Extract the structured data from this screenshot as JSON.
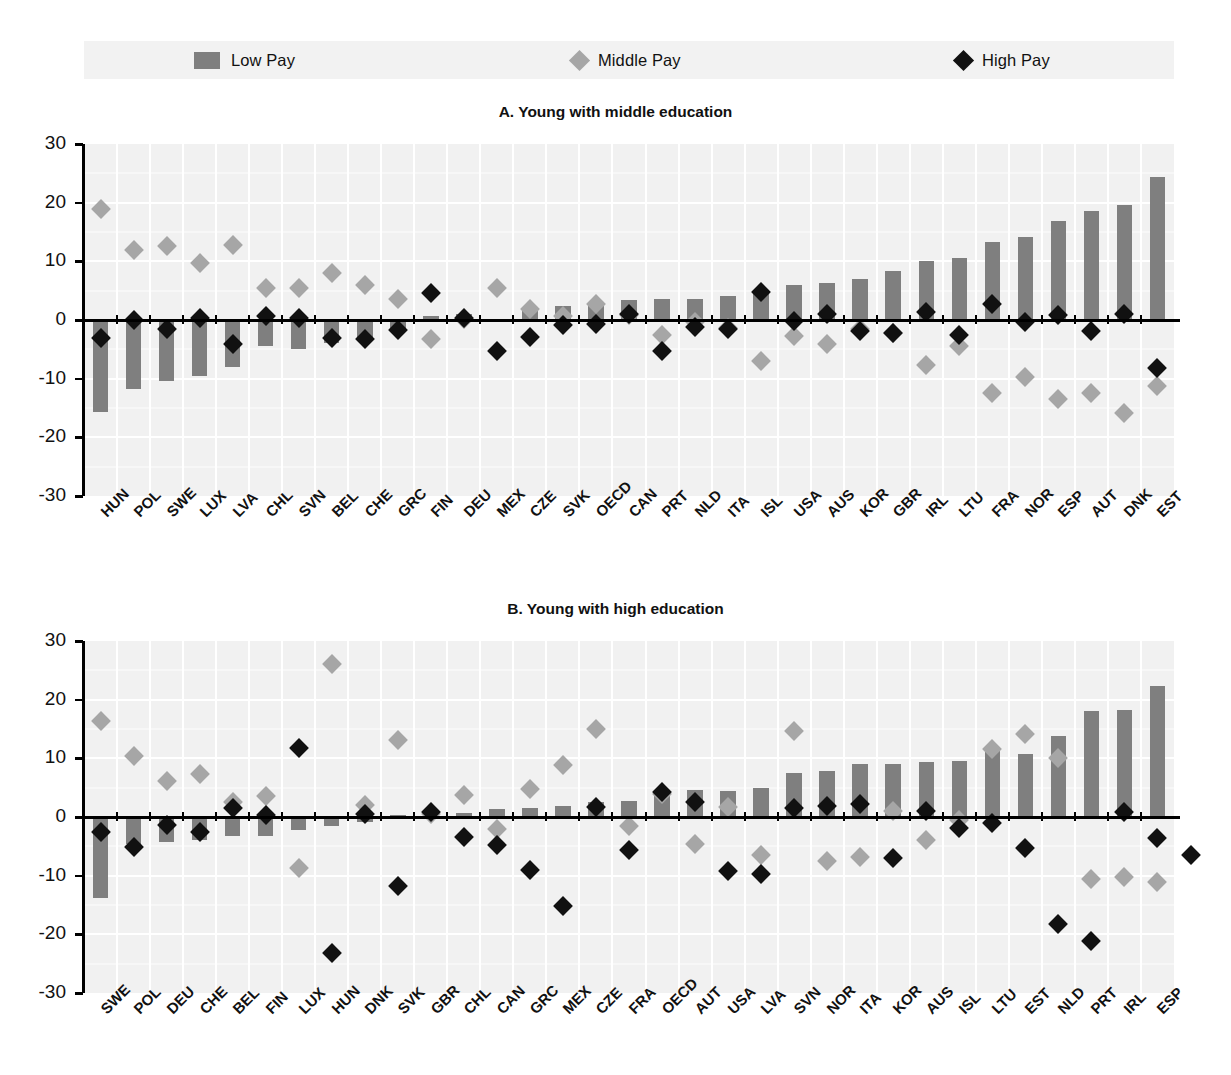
{
  "legend": {
    "items": [
      {
        "label": "Low Pay",
        "marker": "bar-swatch",
        "color": "#7f7f7f"
      },
      {
        "label": "Middle Pay",
        "marker": "diamond-marker",
        "color": "#a6a6a6"
      },
      {
        "label": "High Pay",
        "marker": "diamond-marker",
        "color": "#111111"
      }
    ]
  },
  "axis": {
    "ticks": [
      "30",
      "20",
      "10",
      "0",
      "-10",
      "-20",
      "-30"
    ],
    "ymin": -30,
    "ymax": 30
  },
  "chart_data": [
    {
      "type": "bar",
      "title": "A. Young with middle education",
      "xlabel": "",
      "ylabel": "",
      "ylim": [
        -30,
        30
      ],
      "grid": true,
      "legend_position": "top",
      "categories": [
        "HUN",
        "POL",
        "SWE",
        "LUX",
        "LVA",
        "CHL",
        "SVN",
        "BEL",
        "CHE",
        "GRC",
        "FIN",
        "DEU",
        "MEX",
        "CZE",
        "SVK",
        "OECD",
        "CAN",
        "PRT",
        "NLD",
        "ITA",
        "ISL",
        "USA",
        "AUS",
        "KOR",
        "GBR",
        "IRL",
        "LTU",
        "FRA",
        "NOR",
        "ESP",
        "AUT",
        "DNK",
        "EST"
      ],
      "series": [
        {
          "name": "Low Pay",
          "kind": "bar",
          "color": "#7f7f7f",
          "values": [
            -15.7,
            -11.8,
            -10.4,
            -9.6,
            -8.0,
            -4.5,
            -4.9,
            -4.0,
            -3.4,
            -2.0,
            0.6,
            1.0,
            0.1,
            1.7,
            2.4,
            2.8,
            3.4,
            3.6,
            3.6,
            4.1,
            4.5,
            6.0,
            6.3,
            7.0,
            8.4,
            10.1,
            10.5,
            13.3,
            14.1,
            16.9,
            18.5,
            19.6,
            24.3
          ]
        },
        {
          "name": "Middle Pay",
          "kind": "diamond",
          "color": "#a6a6a6",
          "values": [
            18.9,
            12.0,
            12.6,
            9.7,
            12.7,
            5.4,
            5.4,
            8.0,
            6.0,
            3.6,
            -3.2,
            0.2,
            5.5,
            1.8,
            0.7,
            2.8,
            0.9,
            -2.6,
            -0.4,
            -1.4,
            -7.0,
            -2.8,
            -4.1,
            -1.6,
            -2.3,
            -7.7,
            -4.5,
            -12.4,
            -9.7,
            -13.4,
            -12.4,
            -15.9,
            -11.3
          ]
        },
        {
          "name": "High Pay",
          "kind": "diamond",
          "color": "#111111",
          "values": [
            -3.0,
            0.0,
            -1.6,
            0.3,
            -4.1,
            0.7,
            0.4,
            -3.1,
            -3.2,
            -1.7,
            4.6,
            0.4,
            -5.2,
            -2.9,
            -0.8,
            -0.7,
            1.1,
            -5.3,
            -1.2,
            -1.5,
            4.8,
            -0.2,
            1.0,
            -1.8,
            -2.2,
            1.4,
            -2.5,
            2.8,
            -0.4,
            0.8,
            -1.8,
            1.0,
            -8.2
          ]
        }
      ]
    },
    {
      "type": "bar",
      "title": "B. Young with high education",
      "xlabel": "",
      "ylabel": "",
      "ylim": [
        -30,
        30
      ],
      "grid": true,
      "legend_position": "top",
      "categories": [
        "SWE",
        "POL",
        "DEU",
        "CHE",
        "BEL",
        "FIN",
        "LUX",
        "HUN",
        "DNK",
        "SVK",
        "GBR",
        "CHL",
        "CAN",
        "GRC",
        "MEX",
        "CZE",
        "FRA",
        "OECD",
        "AUT",
        "USA",
        "LVA",
        "SVN",
        "NOR",
        "ITA",
        "KOR",
        "AUS",
        "ISL",
        "LTU",
        "EST",
        "NLD",
        "PRT",
        "IRL",
        "ESP"
      ],
      "series": [
        {
          "name": "Low Pay",
          "kind": "bar",
          "color": "#7f7f7f",
          "values": [
            -13.8,
            -4.6,
            -4.3,
            -3.9,
            -3.3,
            -3.3,
            -2.2,
            -1.6,
            -0.8,
            0.4,
            -0.3,
            0.6,
            1.3,
            1.6,
            1.9,
            2.5,
            2.8,
            4.1,
            4.6,
            4.5,
            5.0,
            7.5,
            7.9,
            9.0,
            9.1,
            9.3,
            9.5,
            11.2,
            10.8,
            13.8,
            18.0,
            18.2,
            22.3
          ]
        },
        {
          "name": "Middle Pay",
          "kind": "diamond",
          "color": "#a6a6a6",
          "values": [
            16.3,
            10.4,
            6.1,
            7.3,
            2.6,
            3.6,
            -8.7,
            26.0,
            2.0,
            13.1,
            0.5,
            3.8,
            -2.1,
            4.8,
            8.9,
            15.0,
            -1.6,
            4.0,
            -4.6,
            1.7,
            -6.5,
            14.7,
            -7.5,
            -6.9,
            1.1,
            -3.9,
            -0.5,
            11.6,
            14.1,
            10.0,
            -10.5,
            -10.3,
            -11.0
          ]
        },
        {
          "name": "High Pay",
          "kind": "diamond",
          "color": "#111111",
          "values": [
            -2.6,
            -5.1,
            -1.3,
            -2.6,
            1.6,
            0.4,
            11.7,
            -23.2,
            0.5,
            -11.8,
            0.8,
            -3.4,
            -4.8,
            -9.1,
            -15.2,
            1.7,
            -5.6,
            4.3,
            2.5,
            -9.2,
            -9.7,
            1.5,
            1.8,
            2.2,
            -7.0,
            1.1,
            -1.9,
            -1.0,
            -5.2,
            -18.3,
            -21.2,
            0.9,
            -3.6,
            -6.5
          ]
        }
      ]
    }
  ]
}
